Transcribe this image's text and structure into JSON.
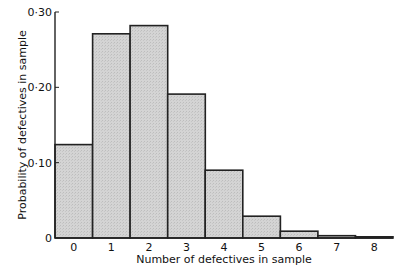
{
  "chart_data": {
    "type": "bar",
    "title": "",
    "xlabel": "Number of defectives in sample",
    "ylabel": "Probability of defectives in sample",
    "categories": [
      "0",
      "1",
      "2",
      "3",
      "4",
      "5",
      "6",
      "7",
      "8"
    ],
    "values": [
      0.124,
      0.271,
      0.282,
      0.191,
      0.09,
      0.029,
      0.009,
      0.003,
      0.001
    ],
    "ylim": [
      0,
      0.3
    ],
    "yticks": [
      0,
      0.1,
      0.2,
      0.3
    ],
    "ytick_labels": [
      "0",
      "0·10",
      "0·20",
      "0·30"
    ],
    "grid": false,
    "legend": null,
    "bar_style": "histogram (adjacent bars, no gaps)",
    "colors": {
      "bar_fill": "#d2d2d2",
      "bar_edge": "#222222",
      "axis": "#222222"
    }
  }
}
